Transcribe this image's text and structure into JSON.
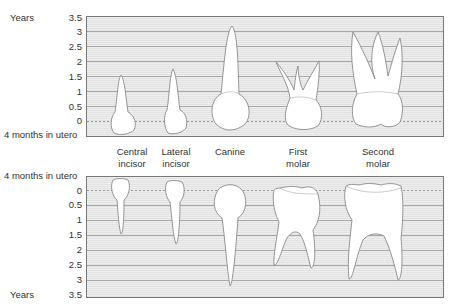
{
  "axis": {
    "unit_label": "Years",
    "utero_label": "4 months in utero",
    "ticks": [
      "3.5",
      "3",
      "2.5",
      "2",
      "1.5",
      "1",
      "0.5",
      "0"
    ]
  },
  "upper_panel": {
    "name": "Maxillary teeth"
  },
  "lower_panel": {
    "name": "Mandibular teeth"
  },
  "teeth": [
    {
      "line1": "Central",
      "line2": "incisor"
    },
    {
      "line1": "Lateral",
      "line2": "incisor"
    },
    {
      "line1": "Canine",
      "line2": ""
    },
    {
      "line1": "First",
      "line2": "molar"
    },
    {
      "line1": "Second",
      "line2": "molar"
    }
  ],
  "colors": {
    "panel_border": "#777777",
    "grid_line": "#aaaaaa",
    "tooth_fill": "#ffffff",
    "tooth_outline": "#8a8a8a"
  }
}
